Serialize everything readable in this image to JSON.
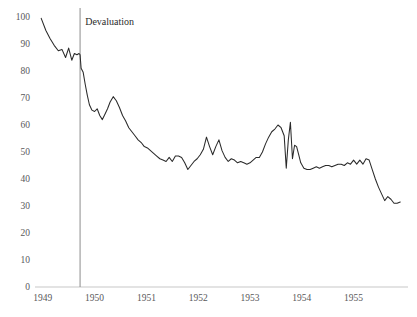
{
  "chart_data": {
    "type": "line",
    "title": "",
    "xlabel": "",
    "ylabel": "",
    "xlim": [
      1948.85,
      1956.05
    ],
    "ylim": [
      0,
      100
    ],
    "grid": false,
    "legend": null,
    "xticks": [
      1949,
      1950,
      1951,
      1952,
      1953,
      1954,
      1955
    ],
    "xtick_labels": [
      "1949",
      "1950",
      "1951",
      "1952",
      "1953",
      "1954",
      "1955"
    ],
    "yticks": [
      0,
      10,
      20,
      30,
      40,
      50,
      60,
      70,
      80,
      90,
      100
    ],
    "ytick_labels": [
      "0",
      "10",
      "20",
      "30",
      "40",
      "50",
      "60",
      "70",
      "80",
      "90",
      "100"
    ],
    "annotations": [
      {
        "text": "Devaluation",
        "type": "vertical-line-with-label",
        "x": 1949.72,
        "label_x": 1949.78,
        "label_y": 97,
        "line_color": "#8d8d8d"
      }
    ],
    "series": [
      {
        "name": "index",
        "color": "#2a2a2a",
        "x": [
          1948.97,
          1949.06,
          1949.14,
          1949.22,
          1949.3,
          1949.37,
          1949.44,
          1949.5,
          1949.56,
          1949.61,
          1949.66,
          1949.7,
          1949.72,
          1949.74,
          1949.78,
          1949.82,
          1949.86,
          1949.9,
          1949.95,
          1950.0,
          1950.05,
          1950.1,
          1950.15,
          1950.2,
          1950.25,
          1950.3,
          1950.36,
          1950.42,
          1950.48,
          1950.54,
          1950.6,
          1950.66,
          1950.72,
          1950.78,
          1950.84,
          1950.9,
          1950.96,
          1951.02,
          1951.08,
          1951.14,
          1951.2,
          1951.26,
          1951.32,
          1951.38,
          1951.44,
          1951.5,
          1951.56,
          1951.62,
          1951.68,
          1951.74,
          1951.8,
          1951.86,
          1951.92,
          1951.98,
          1952.04,
          1952.1,
          1952.16,
          1952.22,
          1952.28,
          1952.34,
          1952.4,
          1952.46,
          1952.52,
          1952.58,
          1952.64,
          1952.7,
          1952.76,
          1952.82,
          1952.88,
          1952.94,
          1953.0,
          1953.06,
          1953.12,
          1953.18,
          1953.24,
          1953.3,
          1953.36,
          1953.42,
          1953.48,
          1953.54,
          1953.6,
          1953.66,
          1953.7,
          1953.74,
          1953.78,
          1953.82,
          1953.86,
          1953.9,
          1953.94,
          1953.98,
          1954.04,
          1954.1,
          1954.16,
          1954.22,
          1954.28,
          1954.34,
          1954.4,
          1954.46,
          1954.52,
          1954.58,
          1954.64,
          1954.7,
          1954.76,
          1954.82,
          1954.88,
          1954.94,
          1955.0,
          1955.06,
          1955.12,
          1955.18,
          1955.24,
          1955.3,
          1955.36,
          1955.42,
          1955.48,
          1955.54,
          1955.6,
          1955.66,
          1955.72,
          1955.78,
          1955.84,
          1955.9
        ],
        "y": [
          99.5,
          95.0,
          92.0,
          89.5,
          87.5,
          88.0,
          85.0,
          88.5,
          84.0,
          86.5,
          86.0,
          86.5,
          86.0,
          81.0,
          79.5,
          75.0,
          71.0,
          67.5,
          65.5,
          65.0,
          66.0,
          63.5,
          62.0,
          64.0,
          66.0,
          68.5,
          70.5,
          69.0,
          66.5,
          63.5,
          61.5,
          59.0,
          57.5,
          56.0,
          54.5,
          53.5,
          52.0,
          51.5,
          50.5,
          49.5,
          48.5,
          47.5,
          47.0,
          46.5,
          48.0,
          46.5,
          48.5,
          48.5,
          48.0,
          46.0,
          43.5,
          45.0,
          46.5,
          47.5,
          49.0,
          51.0,
          55.5,
          52.0,
          49.0,
          52.0,
          54.5,
          50.5,
          48.0,
          46.5,
          47.5,
          47.0,
          46.0,
          46.5,
          46.0,
          45.5,
          46.0,
          47.0,
          48.0,
          48.0,
          50.0,
          53.0,
          55.5,
          57.5,
          58.5,
          60.0,
          59.0,
          56.0,
          44.0,
          54.5,
          61.0,
          47.5,
          52.5,
          52.0,
          49.0,
          46.0,
          44.0,
          43.5,
          43.5,
          44.0,
          44.5,
          44.0,
          44.5,
          45.0,
          45.0,
          44.5,
          45.0,
          45.5,
          45.5,
          45.0,
          46.0,
          45.5,
          47.0,
          45.5,
          47.0,
          45.5,
          47.5,
          47.0,
          43.5,
          40.0,
          37.0,
          34.5,
          32.0,
          33.5,
          32.5,
          31.0,
          31.0,
          31.5
        ]
      }
    ]
  },
  "figure": {
    "background_color": "#ffffff",
    "line_color": "#2a2a2a",
    "tick_color": "#58585a",
    "axis_color": "#b9b9b9"
  }
}
